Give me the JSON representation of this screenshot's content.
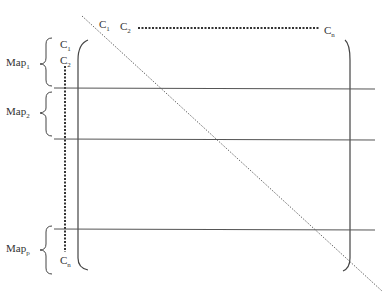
{
  "diagram": {
    "top_labels": {
      "c1": "C",
      "c1_sub": "1",
      "c2": "C",
      "c2_sub": "2",
      "cn": "C",
      "cn_sub": "n"
    },
    "left_labels": {
      "c1": "C",
      "c1_sub": "1",
      "c2": "C",
      "c2_sub": "2",
      "cn": "C",
      "cn_sub": "n"
    },
    "maps": [
      {
        "label": "Map",
        "sub": "1"
      },
      {
        "label": "Map",
        "sub": "2"
      },
      {
        "label": "Map",
        "sub": "p"
      }
    ],
    "colors": {
      "line": "#555555",
      "text": "#333333"
    }
  }
}
